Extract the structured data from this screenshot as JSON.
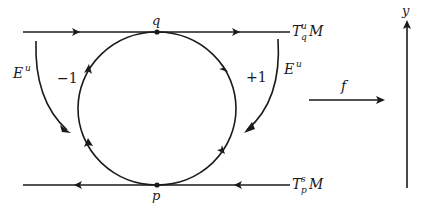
{
  "diagram": {
    "points": {
      "q": {
        "label": "q"
      },
      "p": {
        "label": "p"
      }
    },
    "lines": {
      "top": {
        "label_main": "T",
        "label_sub": "q",
        "label_sup": "u",
        "label_tail": "M",
        "direction": "right"
      },
      "bottom": {
        "label_main": "T",
        "label_sub": "p",
        "label_sup": "s",
        "label_tail": "M",
        "direction": "left"
      }
    },
    "circle": {
      "left_label": "−1",
      "right_label": "+1"
    },
    "bundles": {
      "left": {
        "label_main": "E",
        "label_sup": "u"
      },
      "right": {
        "label_main": "E",
        "label_sup": "u"
      }
    },
    "map": {
      "label": "f"
    },
    "axis": {
      "label": "y"
    },
    "colors": {
      "ink": "#1a1a1a",
      "background": "#ffffff"
    }
  }
}
